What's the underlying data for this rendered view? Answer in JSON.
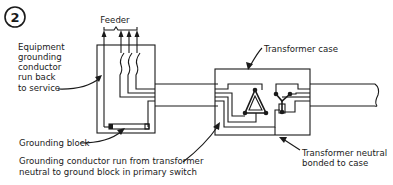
{
  "figure": {
    "number": "2",
    "labels": {
      "feeder": "Feeder",
      "equipment_grounding": [
        "Equipment",
        "grounding",
        "conductor",
        "run back",
        "to service"
      ],
      "grounding_block": "Grounding block",
      "grounding_conductor_run": [
        "Grounding conductor run from transformer",
        "neutral to ground block in primary switch"
      ],
      "transformer_case": "Transformer case",
      "transformer_neutral": [
        "Transformer neutral",
        "bonded to case"
      ]
    },
    "colors": {
      "ink": "#1a1a1a",
      "background": "#ffffff"
    }
  }
}
